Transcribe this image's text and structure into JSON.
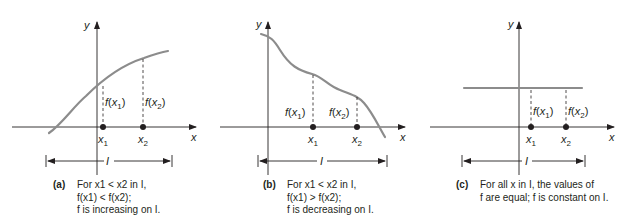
{
  "figure": {
    "panels": [
      {
        "id": "a",
        "tag": "(a)",
        "axis_labels": {
          "x": "x",
          "y": "y"
        },
        "point_labels": [
          "x1",
          "x2"
        ],
        "value_labels": [
          "f(x1)",
          "f(x2)"
        ],
        "interval_label": "I",
        "caption_lines": [
          "For x1 < x2 in I,",
          "f(x1) < f(x2);",
          "f is increasing on I."
        ],
        "behavior": "increasing"
      },
      {
        "id": "b",
        "tag": "(b)",
        "axis_labels": {
          "x": "x",
          "y": "y"
        },
        "point_labels": [
          "x1",
          "x2"
        ],
        "value_labels": [
          "f(x1)",
          "f(x2)"
        ],
        "interval_label": "I",
        "caption_lines": [
          "For x1 < x2 in I,",
          "f(x1) > f(x2);",
          "f is decreasing on I."
        ],
        "behavior": "decreasing"
      },
      {
        "id": "c",
        "tag": "(c)",
        "axis_labels": {
          "x": "x",
          "y": "y"
        },
        "point_labels": [
          "x1",
          "x2"
        ],
        "value_labels": [
          "f(x1)",
          "f(x2)"
        ],
        "interval_label": "I",
        "caption_lines": [
          "For all x in I, the values of",
          "f are equal; f is constant on I."
        ],
        "behavior": "constant"
      }
    ],
    "colors": {
      "curve": "#8c8c8c",
      "ink": "#231f20",
      "background": "#ffffff"
    }
  }
}
